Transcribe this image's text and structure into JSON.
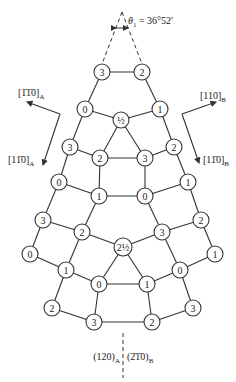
{
  "title_annotation": {
    "angle_symbol": "θ",
    "angle_subscript": "1",
    "angle_value": " = 36°52′"
  },
  "directions": {
    "left_upper": {
      "text": "[1̄1̄0]",
      "sub": "A"
    },
    "left_lower": {
      "text": "[11̄0]",
      "sub": "A"
    },
    "right_upper": {
      "text": "[110]",
      "sub": "B"
    },
    "right_lower": {
      "text": "[11̄0]",
      "sub": "B"
    }
  },
  "boundary": {
    "left": {
      "text": "(120)",
      "sub": "A"
    },
    "right": {
      "text": "(2̄1̄0)",
      "sub": "B"
    }
  },
  "nodes": [
    {
      "id": "n0",
      "label": "3",
      "x": 102,
      "y": 72
    },
    {
      "id": "n1",
      "label": "2",
      "x": 142,
      "y": 72
    },
    {
      "id": "n2",
      "label": "0",
      "x": 85,
      "y": 109
    },
    {
      "id": "n3",
      "label": "½",
      "x": 121,
      "y": 120
    },
    {
      "id": "n4",
      "label": "1",
      "x": 160,
      "y": 109
    },
    {
      "id": "n5",
      "label": "3",
      "x": 70,
      "y": 147
    },
    {
      "id": "n6",
      "label": "2",
      "x": 100,
      "y": 158
    },
    {
      "id": "n7",
      "label": "3",
      "x": 145,
      "y": 158
    },
    {
      "id": "n8",
      "label": "2",
      "x": 174,
      "y": 147
    },
    {
      "id": "n9",
      "label": "0",
      "x": 59,
      "y": 182
    },
    {
      "id": "n10",
      "label": "1",
      "x": 99,
      "y": 196
    },
    {
      "id": "n11",
      "label": "0",
      "x": 145,
      "y": 196
    },
    {
      "id": "n12",
      "label": "1",
      "x": 188,
      "y": 182
    },
    {
      "id": "n13",
      "label": "3",
      "x": 43,
      "y": 220
    },
    {
      "id": "n14",
      "label": "2",
      "x": 82,
      "y": 232
    },
    {
      "id": "n15",
      "label": "2½",
      "x": 123,
      "y": 247
    },
    {
      "id": "n16",
      "label": "3",
      "x": 162,
      "y": 232
    },
    {
      "id": "n17",
      "label": "2",
      "x": 201,
      "y": 220
    },
    {
      "id": "n18",
      "label": "0",
      "x": 30,
      "y": 254
    },
    {
      "id": "n19",
      "label": "1",
      "x": 66,
      "y": 270
    },
    {
      "id": "n20",
      "label": "0",
      "x": 99,
      "y": 284
    },
    {
      "id": "n21",
      "label": "1",
      "x": 147,
      "y": 284
    },
    {
      "id": "n22",
      "label": "0",
      "x": 180,
      "y": 270
    },
    {
      "id": "n23",
      "label": "1",
      "x": 215,
      "y": 254
    },
    {
      "id": "n24",
      "label": "2",
      "x": 52,
      "y": 308
    },
    {
      "id": "n25",
      "label": "3",
      "x": 94,
      "y": 322
    },
    {
      "id": "n26",
      "label": "2",
      "x": 152,
      "y": 322
    },
    {
      "id": "n27",
      "label": "3",
      "x": 193,
      "y": 308
    }
  ],
  "edges": [
    [
      0,
      1
    ],
    [
      0,
      2
    ],
    [
      1,
      4
    ],
    [
      2,
      3
    ],
    [
      3,
      4
    ],
    [
      2,
      5
    ],
    [
      4,
      8
    ],
    [
      3,
      6
    ],
    [
      3,
      7
    ],
    [
      6,
      7
    ],
    [
      5,
      6
    ],
    [
      7,
      8
    ],
    [
      5,
      9
    ],
    [
      8,
      12
    ],
    [
      6,
      10
    ],
    [
      7,
      11
    ],
    [
      10,
      11
    ],
    [
      9,
      10
    ],
    [
      11,
      12
    ],
    [
      9,
      13
    ],
    [
      12,
      17
    ],
    [
      10,
      14
    ],
    [
      11,
      16
    ],
    [
      13,
      14
    ],
    [
      16,
      17
    ],
    [
      14,
      15
    ],
    [
      15,
      16
    ],
    [
      13,
      18
    ],
    [
      17,
      23
    ],
    [
      14,
      19
    ],
    [
      16,
      22
    ],
    [
      18,
      19
    ],
    [
      22,
      23
    ],
    [
      19,
      20
    ],
    [
      21,
      22
    ],
    [
      15,
      20
    ],
    [
      15,
      21
    ],
    [
      20,
      21
    ],
    [
      19,
      24
    ],
    [
      22,
      27
    ],
    [
      20,
      25
    ],
    [
      21,
      26
    ],
    [
      24,
      25
    ],
    [
      25,
      26
    ],
    [
      26,
      27
    ]
  ]
}
